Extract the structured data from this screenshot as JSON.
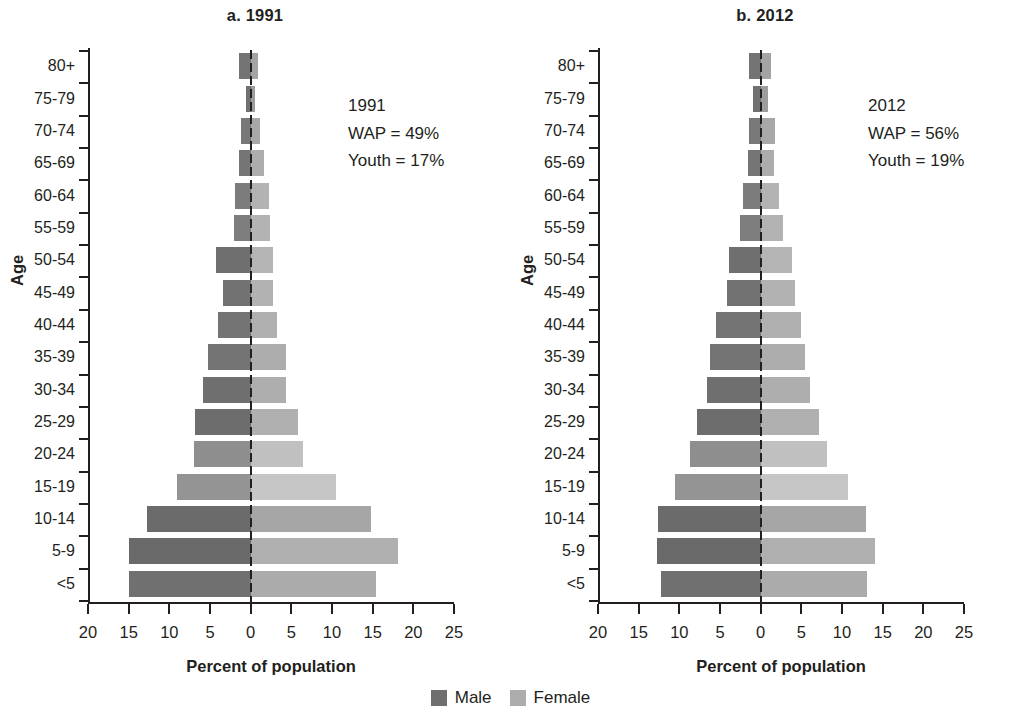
{
  "figure": {
    "legend": {
      "items": [
        {
          "label": "Male",
          "color": "#6f6f6f",
          "name": "legend-male"
        },
        {
          "label": "Female",
          "color": "#adadad",
          "name": "legend-female"
        }
      ]
    }
  },
  "panels": [
    {
      "id": "a",
      "title": "a. 1991",
      "annotation": {
        "line1": "1991",
        "line2": "WAP = 49%",
        "line3": "Youth = 17%"
      },
      "axis_x_title": "Percent of population",
      "axis_y_title": "Age"
    },
    {
      "id": "b",
      "title": "b. 2012",
      "annotation": {
        "line1": "2012",
        "line2": "WAP = 56%",
        "line3": "Youth = 19%"
      },
      "axis_x_title": "Percent of population",
      "axis_y_title": "Age"
    }
  ],
  "chart_data": [
    {
      "type": "bar",
      "subtype": "population-pyramid",
      "title": "a. 1991",
      "xlabel": "Percent of population",
      "ylabel": "Age",
      "xlim": [
        -20,
        25
      ],
      "xticks": [
        20,
        15,
        10,
        5,
        0,
        5,
        10,
        15,
        20,
        25
      ],
      "xtick_values": [
        -20,
        -15,
        -10,
        -5,
        0,
        5,
        10,
        15,
        20,
        25
      ],
      "grid": false,
      "legend_position": "bottom-center",
      "categories": [
        "80+",
        "75-79",
        "70-74",
        "65-69",
        "60-64",
        "55-59",
        "50-54",
        "45-49",
        "40-44",
        "35-39",
        "30-34",
        "25-29",
        "20-24",
        "15-19",
        "10-14",
        "5-9",
        "<5"
      ],
      "series": [
        {
          "name": "Male",
          "values": [
            1.4,
            0.6,
            1.2,
            1.4,
            1.9,
            2.0,
            4.3,
            3.4,
            4.0,
            5.3,
            5.8,
            6.9,
            7.0,
            9.0,
            12.7,
            14.9,
            14.9
          ]
        },
        {
          "name": "Female",
          "values": [
            0.9,
            0.5,
            1.2,
            1.6,
            2.3,
            2.4,
            2.8,
            2.8,
            3.3,
            4.4,
            4.4,
            5.8,
            6.4,
            10.5,
            14.8,
            18.1,
            15.4
          ]
        }
      ],
      "annotations": [
        "1991",
        "WAP = 49%",
        "Youth = 17%"
      ]
    },
    {
      "type": "bar",
      "subtype": "population-pyramid",
      "title": "b. 2012",
      "xlabel": "Percent of population",
      "ylabel": "Age",
      "xlim": [
        -20,
        25
      ],
      "xticks": [
        20,
        15,
        10,
        5,
        0,
        5,
        10,
        15,
        20,
        25
      ],
      "xtick_values": [
        -20,
        -15,
        -10,
        -5,
        0,
        5,
        10,
        15,
        20,
        25
      ],
      "grid": false,
      "legend_position": "bottom-center",
      "categories": [
        "80+",
        "75-79",
        "70-74",
        "65-69",
        "60-64",
        "55-59",
        "50-54",
        "45-49",
        "40-44",
        "35-39",
        "30-34",
        "25-29",
        "20-24",
        "15-19",
        "10-14",
        "5-9",
        "<5"
      ],
      "series": [
        {
          "name": "Male",
          "values": [
            1.4,
            0.9,
            1.4,
            1.5,
            2.2,
            2.6,
            3.9,
            4.2,
            5.5,
            6.2,
            6.6,
            7.8,
            8.7,
            10.5,
            12.6,
            12.7,
            12.2
          ]
        },
        {
          "name": "Female",
          "values": [
            1.3,
            0.9,
            1.8,
            1.7,
            2.2,
            2.7,
            3.8,
            4.2,
            4.9,
            5.4,
            6.1,
            7.2,
            8.2,
            10.7,
            13.0,
            14.0,
            13.1
          ]
        }
      ],
      "annotations": [
        "2012",
        "WAP = 56%",
        "Youth = 19%"
      ]
    }
  ],
  "bar_colors": {
    "male": [
      "#747474",
      "#707070",
      "#787878",
      "#757575",
      "#7c7c7c",
      "#7d7d7d",
      "#6f6f6f",
      "#727272",
      "#747474",
      "#747474",
      "#6f6f6f",
      "#6d6d6d",
      "#8e8e8e",
      "#949494",
      "#6b6b6b",
      "#6a6a6a",
      "#707070"
    ],
    "female": [
      "#a4a4a4",
      "#9d9d9d",
      "#a8a8a8",
      "#adadad",
      "#b3b3b3",
      "#b3b3b3",
      "#b4b4b4",
      "#b2b2b2",
      "#b0b0b0",
      "#adadad",
      "#aeaeae",
      "#b0b0b0",
      "#c0c0c0",
      "#c6c6c6",
      "#a6a6a6",
      "#afafaf",
      "#ababab"
    ]
  }
}
